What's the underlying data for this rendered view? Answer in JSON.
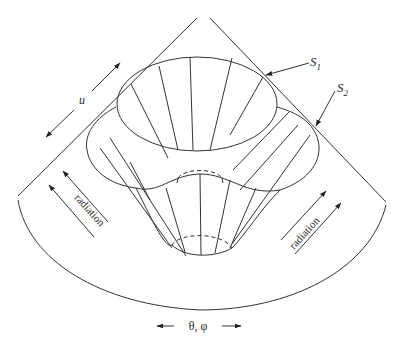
{
  "figure": {
    "labels": {
      "u": "u",
      "s1_main": "S",
      "s1_sub": "1",
      "s2_main": "S",
      "s2_sub": "2",
      "radiation_left": "radiation",
      "radiation_right": "radiation",
      "angle_axis": "θ, φ"
    },
    "colors": {
      "line": "#333333",
      "background": "#ffffff"
    }
  }
}
